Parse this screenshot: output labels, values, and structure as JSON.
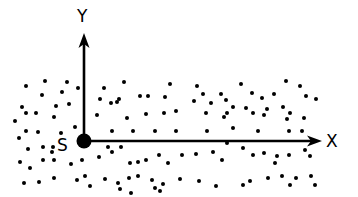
{
  "diagram": {
    "type": "coordinate-axes-with-particle-field",
    "axes": {
      "x_label": "X",
      "y_label": "Y",
      "origin_label": "S"
    },
    "colors": {
      "ink": "#000000",
      "background": "#ffffff"
    },
    "dots": [
      [
        26,
        86
      ],
      [
        45,
        81
      ],
      [
        67,
        82
      ],
      [
        78,
        88
      ],
      [
        42,
        95
      ],
      [
        62,
        92
      ],
      [
        104,
        88
      ],
      [
        124,
        82
      ],
      [
        170,
        84
      ],
      [
        197,
        86
      ],
      [
        203,
        94
      ],
      [
        241,
        84
      ],
      [
        286,
        81
      ],
      [
        300,
        86
      ],
      [
        306,
        96
      ],
      [
        274,
        94
      ],
      [
        165,
        97
      ],
      [
        221,
        94
      ],
      [
        226,
        100
      ],
      [
        252,
        93
      ],
      [
        262,
        98
      ],
      [
        140,
        96
      ],
      [
        148,
        96
      ],
      [
        119,
        99
      ],
      [
        100,
        99
      ],
      [
        111,
        103
      ],
      [
        117,
        102
      ],
      [
        22,
        107
      ],
      [
        36,
        113
      ],
      [
        56,
        106
      ],
      [
        69,
        104
      ],
      [
        176,
        111
      ],
      [
        194,
        101
      ],
      [
        211,
        103
      ],
      [
        227,
        113
      ],
      [
        246,
        108
      ],
      [
        267,
        109
      ],
      [
        233,
        107
      ],
      [
        253,
        113
      ],
      [
        283,
        107
      ],
      [
        290,
        113
      ],
      [
        316,
        99
      ],
      [
        15,
        121
      ],
      [
        26,
        113
      ],
      [
        54,
        117
      ],
      [
        97,
        115
      ],
      [
        127,
        118
      ],
      [
        146,
        114
      ],
      [
        164,
        113
      ],
      [
        206,
        113
      ],
      [
        224,
        117
      ],
      [
        264,
        115
      ],
      [
        287,
        119
      ],
      [
        304,
        118
      ],
      [
        19,
        138
      ],
      [
        26,
        131
      ],
      [
        38,
        132
      ],
      [
        61,
        133
      ],
      [
        75,
        127
      ],
      [
        112,
        131
      ],
      [
        133,
        131
      ],
      [
        155,
        131
      ],
      [
        176,
        131
      ],
      [
        207,
        131
      ],
      [
        233,
        128
      ],
      [
        258,
        131
      ],
      [
        289,
        131
      ],
      [
        302,
        131
      ],
      [
        28,
        149
      ],
      [
        43,
        147
      ],
      [
        53,
        147
      ],
      [
        52,
        152
      ],
      [
        20,
        162
      ],
      [
        30,
        168
      ],
      [
        43,
        160
      ],
      [
        54,
        160
      ],
      [
        71,
        164
      ],
      [
        82,
        160
      ],
      [
        99,
        157
      ],
      [
        108,
        147
      ],
      [
        112,
        152
      ],
      [
        121,
        147
      ],
      [
        130,
        163
      ],
      [
        138,
        162
      ],
      [
        146,
        160
      ],
      [
        159,
        155
      ],
      [
        168,
        163
      ],
      [
        182,
        155
      ],
      [
        196,
        154
      ],
      [
        213,
        152
      ],
      [
        222,
        160
      ],
      [
        227,
        143
      ],
      [
        243,
        148
      ],
      [
        253,
        155
      ],
      [
        264,
        153
      ],
      [
        275,
        163
      ],
      [
        289,
        155
      ],
      [
        305,
        150
      ],
      [
        310,
        156
      ],
      [
        24,
        183
      ],
      [
        39,
        182
      ],
      [
        54,
        178
      ],
      [
        77,
        180
      ],
      [
        85,
        176
      ],
      [
        105,
        179
      ],
      [
        118,
        183
      ],
      [
        129,
        178
      ],
      [
        138,
        176
      ],
      [
        152,
        180
      ],
      [
        163,
        184
      ],
      [
        180,
        179
      ],
      [
        199,
        181
      ],
      [
        216,
        186
      ],
      [
        243,
        185
      ],
      [
        250,
        181
      ],
      [
        268,
        178
      ],
      [
        282,
        176
      ],
      [
        296,
        178
      ],
      [
        311,
        176
      ],
      [
        315,
        185
      ],
      [
        290,
        185
      ],
      [
        277,
        156
      ],
      [
        120,
        189
      ],
      [
        131,
        193
      ],
      [
        155,
        188
      ],
      [
        160,
        191
      ],
      [
        90,
        186
      ]
    ]
  }
}
